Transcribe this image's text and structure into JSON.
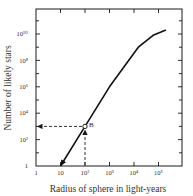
{
  "chart_data": {
    "type": "line",
    "title": "",
    "xlabel": "Radius of sphere in light-years",
    "ylabel": "Number of likely stars",
    "xscale": "log",
    "yscale": "log",
    "xlim": [
      1,
      200000
    ],
    "ylim": [
      1,
      100000000000.0
    ],
    "grid": false,
    "x_ticks": [
      {
        "value": 1,
        "label": "1"
      },
      {
        "value": 10,
        "label": "10"
      },
      {
        "value": 100,
        "label": "10²"
      },
      {
        "value": 1000,
        "label": "10³"
      },
      {
        "value": 10000,
        "label": "10⁴"
      },
      {
        "value": 100000,
        "label": "10⁵"
      }
    ],
    "y_ticks": [
      {
        "value": 1,
        "label": "1"
      },
      {
        "value": 100,
        "label": "10²"
      },
      {
        "value": 10000,
        "label": "10⁴"
      },
      {
        "value": 1000000,
        "label": "10⁶"
      },
      {
        "value": 100000000,
        "label": "10⁸"
      },
      {
        "value": 10000000000,
        "label": "10¹⁰"
      }
    ],
    "series": [
      {
        "name": "Number of likely stars vs radius",
        "x": [
          10,
          100,
          1000,
          15000,
          60000,
          200000
        ],
        "y": [
          1,
          1000,
          1000000,
          1000000000,
          8000000000,
          20000000000
        ]
      }
    ],
    "annotations": [
      {
        "label": "B",
        "x": 100,
        "y": 1000,
        "marker": "open-circle",
        "note": "dashed arrows from B to y-axis and up from x-axis"
      }
    ]
  }
}
